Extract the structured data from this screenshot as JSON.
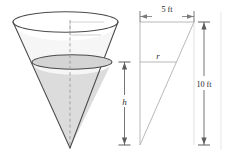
{
  "figure": {
    "colors": {
      "outline": "#4a4a4a",
      "water_fill": "#dcdcdc",
      "empty_fill": "#f3f3f3",
      "construction": "#b8b8b8",
      "dimension": "#6b6b6b",
      "text": "#2b2b2b",
      "background": "#ffffff"
    },
    "cone": {
      "name": "inverted-cone",
      "rim_label": "",
      "water_surface_label": "",
      "axis_style": "dashed"
    },
    "triangle": {
      "name": "cross-section-triangle",
      "hypotenuse_style": "solid",
      "inner_line_style": "solid"
    },
    "labels": {
      "top_width": "5 ft",
      "full_height": "10 ft",
      "water_height": "h",
      "water_radius": "r"
    }
  }
}
